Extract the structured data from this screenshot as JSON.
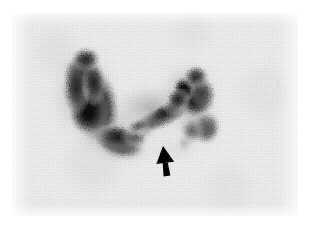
{
  "figure": {
    "modality": "thyroid-scintigram",
    "page_background": "#ffffff",
    "field": {
      "x": 12,
      "y": 13,
      "width": 286,
      "height": 203,
      "background_color": "#f1f1f1",
      "noise": "speckled counting noise"
    },
    "grayscale": {
      "paper": "#ffffff",
      "background": "#f1f1f1",
      "faint_uptake": "#c8c8c8",
      "moderate_uptake": "#8a8a8a",
      "high_uptake": "#3a3a3a",
      "max_uptake": "#101010",
      "annotation": "#000000"
    },
    "regions": [
      {
        "name": "left-lobe-hot-region",
        "label": "Left lobe (viewer left) — intense tracer uptake",
        "center_x": 84,
        "center_y": 93,
        "rx": 25,
        "ry": 40,
        "rotation": -8,
        "peak_intensity": "max_uptake"
      },
      {
        "name": "left-lobe-inferior-extension",
        "label": "Inferior curving extension of the left lobe",
        "center_x": 107,
        "center_y": 129,
        "rx": 28,
        "ry": 17,
        "rotation": 18,
        "peak_intensity": "high_uptake"
      },
      {
        "name": "isthmus-band",
        "label": "Oblique band of uptake crossing toward the right lobe",
        "center_x": 150,
        "center_y": 104,
        "rx": 38,
        "ry": 12,
        "rotation": -24,
        "peak_intensity": "high_uptake"
      },
      {
        "name": "right-lobe-hot-region",
        "label": "Right lobe (viewer right) — focal intense uptake",
        "center_x": 185,
        "center_y": 84,
        "rx": 20,
        "ry": 23,
        "rotation": 20,
        "peak_intensity": "max_uptake"
      },
      {
        "name": "right-lobe-inferior-tail",
        "label": "Inferior tail of the right lobe",
        "center_x": 194,
        "center_y": 115,
        "rx": 16,
        "ry": 18,
        "rotation": 10,
        "peak_intensity": "moderate_uptake"
      },
      {
        "name": "photopenic-defect",
        "label": "Photopenic (cold) area indicated by the arrow",
        "center_x": 152,
        "center_y": 132,
        "rx": 17,
        "ry": 13,
        "rotation": 0,
        "peak_intensity": "background"
      }
    ],
    "annotation": {
      "name": "pointer-arrow",
      "shape": "solid-black-arrow",
      "points_to": "photopenic-defect",
      "direction": "up",
      "tip_x": 151,
      "tip_y": 133,
      "tail_x": 155,
      "tail_y": 163,
      "color": "#000000"
    }
  }
}
